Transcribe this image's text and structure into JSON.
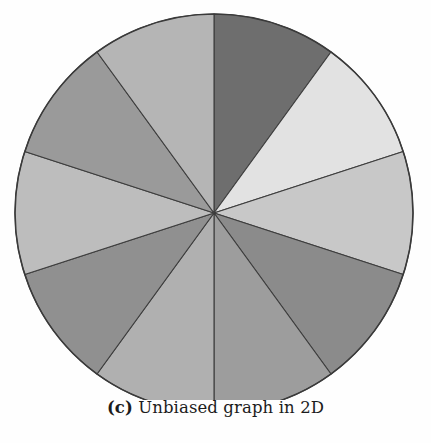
{
  "caption": {
    "label": "(c)",
    "text": " Unbiased graph in 2D",
    "full": "(c) Unbiased graph in 2D"
  },
  "figure": {
    "background_color": "#fefefe",
    "outline_color": "#3a3a3a",
    "divider_color": "#3d3d3d"
  },
  "chart_data": {
    "type": "pie",
    "title": "(c) Unbiased graph in 2D",
    "subtitle": "",
    "xlabel": "",
    "ylabel": "",
    "legend": "none",
    "grid": false,
    "start_angle_deg": 0,
    "direction": "clockwise",
    "center": [
      214,
      213
    ],
    "radius": 199,
    "slice_count": 10,
    "slice_angle_deg": 36,
    "categories": [
      "1",
      "2",
      "3",
      "4",
      "5",
      "6",
      "7",
      "8",
      "9",
      "10"
    ],
    "values": [
      10,
      10,
      10,
      10,
      10,
      10,
      10,
      10,
      10,
      10
    ],
    "percentages": [
      10,
      10,
      10,
      10,
      10,
      10,
      10,
      10,
      10,
      10
    ],
    "colors": [
      "#6e6e6e",
      "#e2e2e2",
      "#c8c8c8",
      "#8b8b8b",
      "#9d9d9d",
      "#b0b0b0",
      "#909090",
      "#bdbdbd",
      "#9a9a9a",
      "#b5b5b5"
    ],
    "slices": [
      {
        "index": 1,
        "start_deg": 0,
        "end_deg": 36,
        "value": 10,
        "color": "#6e6e6e"
      },
      {
        "index": 2,
        "start_deg": 36,
        "end_deg": 72,
        "value": 10,
        "color": "#e2e2e2"
      },
      {
        "index": 3,
        "start_deg": 72,
        "end_deg": 108,
        "value": 10,
        "color": "#c8c8c8"
      },
      {
        "index": 4,
        "start_deg": 108,
        "end_deg": 144,
        "value": 10,
        "color": "#8b8b8b"
      },
      {
        "index": 5,
        "start_deg": 144,
        "end_deg": 180,
        "value": 10,
        "color": "#9d9d9d"
      },
      {
        "index": 6,
        "start_deg": 180,
        "end_deg": 216,
        "value": 10,
        "color": "#b0b0b0"
      },
      {
        "index": 7,
        "start_deg": 216,
        "end_deg": 252,
        "value": 10,
        "color": "#909090"
      },
      {
        "index": 8,
        "start_deg": 252,
        "end_deg": 288,
        "value": 10,
        "color": "#bdbdbd"
      },
      {
        "index": 9,
        "start_deg": 288,
        "end_deg": 324,
        "value": 10,
        "color": "#9a9a9a"
      },
      {
        "index": 10,
        "start_deg": 324,
        "end_deg": 360,
        "value": 10,
        "color": "#b5b5b5"
      }
    ]
  }
}
